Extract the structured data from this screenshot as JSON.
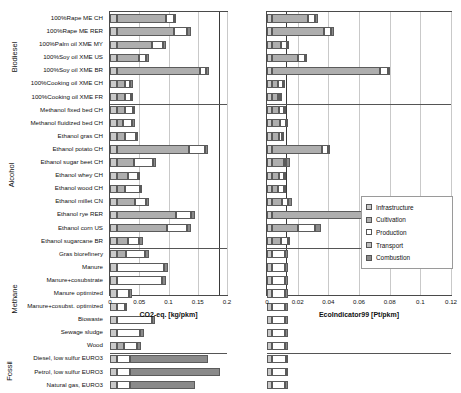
{
  "chart_data": {
    "type": "bar",
    "orientation": "horizontal",
    "stacked": true,
    "title": "",
    "panels": [
      {
        "id": "left",
        "xlabel": "CO2-eq. [kg/pkm]",
        "xlim": [
          0,
          0.2
        ],
        "xticks": [
          0,
          0.05,
          0.1,
          0.15,
          0.2
        ],
        "xticklabels": [
          "0",
          "0.05",
          "0.1",
          "0.15",
          "0.2"
        ],
        "reference_line": 0.186,
        "grid": true
      },
      {
        "id": "right",
        "xlabel": "EcoIndicator99 [Pt/pkm]",
        "xlim": [
          0,
          0.12
        ],
        "xticks": [
          0,
          0.02,
          0.04,
          0.06,
          0.08,
          0.1,
          0.12
        ],
        "xticklabels": [
          "0",
          "0.02",
          "0.04",
          "0.06",
          "0.08",
          "0.1",
          "0.12"
        ],
        "reference_line": 0.0125,
        "grid": true
      }
    ],
    "legend": {
      "position": "right-middle",
      "entries": [
        {
          "name": "Infrastructure",
          "color": "#c9c9c9"
        },
        {
          "name": "Cultivation",
          "color": "#aeaeae"
        },
        {
          "name": "Production",
          "color": "#ffffff"
        },
        {
          "name": "Transport",
          "color": "#bdbdbd"
        },
        {
          "name": "Combustion",
          "color": "#8a8a8a"
        }
      ]
    },
    "series": [
      "Infrastructure",
      "Cultivation",
      "Production",
      "Transport",
      "Combustion"
    ],
    "groups": [
      {
        "name": "Biodiesel",
        "rows": [
          {
            "label": "100%Rape ME CH",
            "left": [
              0.012,
              0.083,
              0.014,
              0.0,
              0.004
            ],
            "right": [
              0.0035,
              0.0235,
              0.0045,
              0.0,
              0.0015
            ]
          },
          {
            "label": "100%Rape ME RER",
            "left": [
              0.012,
              0.098,
              0.022,
              0.0,
              0.006
            ],
            "right": [
              0.0035,
              0.0335,
              0.005,
              0.0,
              0.0015
            ]
          },
          {
            "label": "100%Palm oil XME MY",
            "left": [
              0.012,
              0.06,
              0.019,
              0.0,
              0.005
            ],
            "right": [
              0.0035,
              0.0055,
              0.004,
              0.0,
              0.0015
            ]
          },
          {
            "label": "100%Soy oil XME US",
            "left": [
              0.012,
              0.038,
              0.012,
              0.0,
              0.005
            ],
            "right": [
              0.0035,
              0.0165,
              0.0045,
              0.0,
              0.0015
            ]
          },
          {
            "label": "100%Soy oil XME BR",
            "left": [
              0.012,
              0.141,
              0.011,
              0.0,
              0.006
            ],
            "right": [
              0.0035,
              0.0705,
              0.005,
              0.0,
              0.0015
            ]
          },
          {
            "label": "100%Cooking oil XME CH",
            "left": [
              0.012,
              0.013,
              0.009,
              0.0,
              0.006
            ],
            "right": [
              0.0035,
              0.004,
              0.003,
              0.0,
              0.0015
            ]
          },
          {
            "label": "100%Cooking oil XME FR",
            "left": [
              0.012,
              0.013,
              0.011,
              0.0,
              0.002
            ],
            "right": [
              0.0035,
              0.0035,
              0.0015,
              0.0,
              0.0015
            ]
          }
        ]
      },
      {
        "name": "Alcohol",
        "rows": [
          {
            "label": "Methanol fixed bed CH",
            "left": [
              0.012,
              0.013,
              0.014,
              0.0,
              0.002
            ],
            "right": [
              0.0035,
              0.0045,
              0.003,
              0.0,
              0.0015
            ]
          },
          {
            "label": "Methanol fluidized bed CH",
            "left": [
              0.012,
              0.011,
              0.014,
              0.0,
              0.005
            ],
            "right": [
              0.0035,
              0.005,
              0.004,
              0.0,
              0.0015
            ]
          },
          {
            "label": "Ethanol gras CH",
            "left": [
              0.012,
              0.013,
              0.019,
              0.0,
              0.002
            ],
            "right": [
              0.0035,
              0.0045,
              0.0015,
              0.0,
              0.0015
            ]
          },
          {
            "label": "Ethanol potato CH",
            "left": [
              0.012,
              0.123,
              0.028,
              0.0,
              0.004
            ],
            "right": [
              0.0035,
              0.0325,
              0.0035,
              0.0,
              0.0015
            ]
          },
          {
            "label": "Ethanol sugar beet CH",
            "left": [
              0.012,
              0.029,
              0.033,
              0.0,
              0.005
            ],
            "right": [
              0.0035,
              0.0075,
              0.0015,
              0.0,
              0.0025
            ]
          },
          {
            "label": "Ethanol whey CH",
            "left": [
              0.012,
              0.019,
              0.017,
              0.0,
              0.002
            ],
            "right": [
              0.0035,
              0.0045,
              0.003,
              0.0,
              0.0015
            ]
          },
          {
            "label": "Ethanol wood CH",
            "left": [
              0.012,
              0.013,
              0.026,
              0.0,
              0.004
            ],
            "right": [
              0.0035,
              0.004,
              0.0035,
              0.0,
              0.0015
            ]
          },
          {
            "label": "Ethanol millet CN",
            "left": [
              0.012,
              0.03,
              0.02,
              0.0,
              0.005
            ],
            "right": [
              0.0035,
              0.0065,
              0.0035,
              0.0,
              0.0025
            ]
          },
          {
            "label": "Ethanol rye RER",
            "left": [
              0.012,
              0.1,
              0.027,
              0.0,
              0.006
            ],
            "right": [
              0.0035,
              0.1055,
              0.004,
              0.0,
              0.0015
            ]
          },
          {
            "label": "Ethanol corn US",
            "left": [
              0.012,
              0.086,
              0.033,
              0.0,
              0.008
            ],
            "right": [
              0.0035,
              0.0165,
              0.0115,
              0.0,
              0.0035
            ]
          },
          {
            "label": "Ethanol sugarcane BR",
            "left": [
              0.012,
              0.018,
              0.02,
              0.0,
              0.006
            ],
            "right": [
              0.0035,
              0.0055,
              0.0045,
              0.0,
              0.0015
            ]
          }
        ]
      },
      {
        "name": "Methane",
        "rows": [
          {
            "label": "Gras biorefinery",
            "left": [
              0.012,
              0.016,
              0.031,
              0.0,
              0.007
            ],
            "right": [
              0.0035,
              0.0,
              0.0085,
              0.0,
              0.0015
            ]
          },
          {
            "label": "Manure",
            "left": [
              0.012,
              0.0,
              0.081,
              0.0,
              0.006
            ],
            "right": [
              0.0035,
              0.0,
              0.0085,
              0.0,
              0.0015
            ]
          },
          {
            "label": "Manure+cosubstrate",
            "left": [
              0.012,
              0.0,
              0.077,
              0.0,
              0.006
            ],
            "right": [
              0.0035,
              0.0,
              0.0085,
              0.0,
              0.0015
            ]
          },
          {
            "label": "Manure optimized",
            "left": [
              0.012,
              0.0,
              0.02,
              0.0,
              0.006
            ],
            "right": [
              0.0035,
              0.0,
              0.0085,
              0.0,
              0.0015
            ]
          },
          {
            "label": "Manure+cosubst. optimized",
            "left": [
              0.012,
              0.0,
              0.013,
              0.0,
              0.004
            ],
            "right": [
              0.0035,
              0.0,
              0.0085,
              0.0,
              0.0015
            ]
          },
          {
            "label": "Biowaste",
            "left": [
              0.012,
              0.0,
              0.059,
              0.0,
              0.006
            ],
            "right": [
              0.0035,
              0.0,
              0.0085,
              0.0,
              0.0015
            ]
          },
          {
            "label": "Sewage sludge",
            "left": [
              0.012,
              0.0,
              0.04,
              0.0,
              0.006
            ],
            "right": [
              0.0035,
              0.0,
              0.0085,
              0.0,
              0.0015
            ]
          },
          {
            "label": "Wood",
            "left": [
              0.012,
              0.012,
              0.023,
              0.0,
              0.006
            ],
            "right": [
              0.0035,
              0.0,
              0.0085,
              0.0,
              0.0015
            ]
          }
        ]
      },
      {
        "name": "Fossil",
        "rows": [
          {
            "label": "Diesel, low sulfur EURO3",
            "left": [
              0.012,
              0.0,
              0.022,
              0.0,
              0.133
            ],
            "right": [
              0.0035,
              0.0,
              0.009,
              0.0,
              0.0015
            ]
          },
          {
            "label": "Petrol, low sulfur EURO3",
            "left": [
              0.012,
              0.0,
              0.022,
              0.0,
              0.154
            ],
            "right": [
              0.0035,
              0.0,
              0.009,
              0.0,
              0.0015
            ]
          },
          {
            "label": "Natural gas, EURO3",
            "left": [
              0.012,
              0.0,
              0.022,
              0.0,
              0.111
            ],
            "right": [
              0.0035,
              0.0,
              0.0085,
              0.0,
              0.0015
            ]
          }
        ]
      }
    ]
  }
}
